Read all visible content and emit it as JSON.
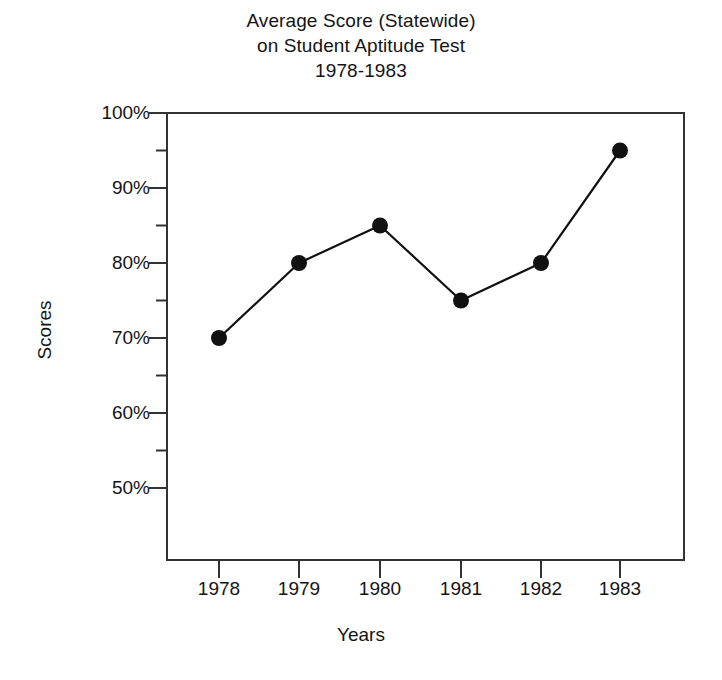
{
  "chart_data": {
    "type": "line",
    "title": "Average Score (Statewide) on Student Aptitude Test 1978-1983",
    "title_lines": [
      "Average Score (Statewide)",
      "on Student Aptitude Test",
      "1978-1983"
    ],
    "xlabel": "Years",
    "ylabel": "Scores",
    "categories": [
      "1978",
      "1979",
      "1980",
      "1981",
      "1982",
      "1983"
    ],
    "x": [
      1978,
      1979,
      1980,
      1981,
      1982,
      1983
    ],
    "values": [
      70,
      80,
      85,
      75,
      80,
      95
    ],
    "value_labels": [
      "70%",
      "80%",
      "85%",
      "75%",
      "80%",
      "95%"
    ],
    "series": [
      {
        "name": "Average Score (Statewide)",
        "values": [
          70,
          80,
          85,
          75,
          80,
          95
        ]
      }
    ],
    "ylim": [
      45,
      100
    ],
    "ytick_values": [
      100,
      90,
      80,
      70,
      60,
      50
    ],
    "ytick_labels": [
      "100%",
      "90%",
      "80%",
      "70%",
      "60%",
      "50%"
    ],
    "yminor_values": [
      95,
      85,
      75,
      65,
      55
    ],
    "grid": false,
    "legend": false,
    "legend_position": "none",
    "marker": "filled-circle",
    "line_color": "#111111",
    "marker_color": "#111111",
    "axis_color": "#333333",
    "background_color": "#ffffff"
  }
}
